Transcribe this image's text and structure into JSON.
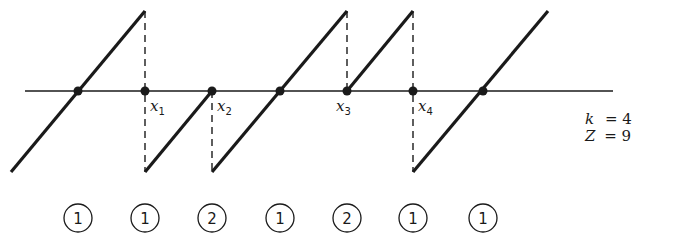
{
  "figure": {
    "axis": {
      "x1": 25,
      "x2": 613,
      "y": 91
    },
    "segments": [
      {
        "x1": 11,
        "y1": 172,
        "x2": 145,
        "y2": 11
      },
      {
        "x1": 145,
        "y1": 172,
        "x2": 212,
        "y2": 91
      },
      {
        "x1": 212,
        "y1": 172,
        "x2": 347,
        "y2": 11
      },
      {
        "x1": 347,
        "y1": 91,
        "x2": 413,
        "y2": 11
      },
      {
        "x1": 413,
        "y1": 172,
        "x2": 548,
        "y2": 11
      }
    ],
    "dashed": [
      {
        "x": 145,
        "y1": 11,
        "y2": 172
      },
      {
        "x": 212,
        "y1": 91,
        "y2": 172
      },
      {
        "x": 347,
        "y1": 11,
        "y2": 91
      },
      {
        "x": 413,
        "y1": 11,
        "y2": 172
      }
    ],
    "dots": [
      78,
      145,
      212,
      280,
      347,
      413,
      483
    ],
    "labels": [
      {
        "var": "x",
        "sub": "1",
        "x": 150,
        "y": 111
      },
      {
        "var": "x",
        "sub": "2",
        "x": 217,
        "y": 111
      },
      {
        "var": "x",
        "sub": "3",
        "x": 336,
        "y": 111
      },
      {
        "var": "x",
        "sub": "4",
        "x": 418,
        "y": 111
      }
    ],
    "params": [
      {
        "var": "k",
        "value": "= 4"
      },
      {
        "var": "Z",
        "value": "= 9"
      }
    ],
    "circles": [
      {
        "x": 78,
        "label": "1"
      },
      {
        "x": 145,
        "label": "1"
      },
      {
        "x": 212,
        "label": "2"
      },
      {
        "x": 280,
        "label": "1"
      },
      {
        "x": 347,
        "label": "2"
      },
      {
        "x": 413,
        "label": "1"
      },
      {
        "x": 483,
        "label": "1"
      }
    ],
    "circle_y": 218,
    "circle_r": 14
  }
}
